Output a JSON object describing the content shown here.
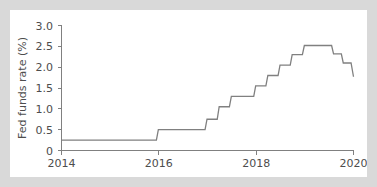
{
  "figure": {
    "background_color": "#d9d9d9",
    "panel_color": "#ffffff",
    "line_color": "#808080",
    "axis_color": "#808080",
    "text_color": "#4d4d4d"
  },
  "chart_data": {
    "type": "line",
    "title": "",
    "xlabel": "",
    "ylabel": "Fed funds rate (%)",
    "xlim": [
      2014.0,
      2020.0
    ],
    "ylim": [
      0,
      3.0
    ],
    "grid": false,
    "legend": false,
    "x_ticks": [
      2014,
      2016,
      2018,
      2020
    ],
    "x_tick_labels": [
      "2014",
      "2016",
      "2018",
      "2020"
    ],
    "y_ticks": [
      0,
      0.5,
      1.0,
      1.5,
      2.0,
      2.5,
      3.0
    ],
    "y_tick_labels": [
      "0",
      "0.5",
      "1.0",
      "1.5",
      "2.0",
      "2.5",
      "3.0"
    ],
    "series": [
      {
        "name": "Fed funds rate",
        "style": "step-post",
        "x": [
          2014.0,
          2015.95,
          2015.99,
          2016.95,
          2016.99,
          2017.2,
          2017.24,
          2017.45,
          2017.49,
          2017.95,
          2017.99,
          2018.2,
          2018.24,
          2018.45,
          2018.49,
          2018.7,
          2018.74,
          2018.95,
          2018.99,
          2019.55,
          2019.59,
          2019.75,
          2019.79,
          2019.95,
          2020.0
        ],
        "y": [
          0.25,
          0.25,
          0.5,
          0.5,
          0.75,
          0.75,
          1.05,
          1.05,
          1.3,
          1.3,
          1.55,
          1.55,
          1.8,
          1.8,
          2.05,
          2.05,
          2.3,
          2.3,
          2.52,
          2.52,
          2.32,
          2.32,
          2.1,
          2.1,
          1.77
        ]
      }
    ],
    "annotations": [],
    "key_points": {
      "start_rate": 0.25,
      "start_year": 2014,
      "first_hike_year": 2015.99,
      "first_hike_rate": 0.5,
      "peak_rate": 2.5,
      "peak_year_start": 2018.99,
      "peak_year_end": 2019.55,
      "end_rate": 1.75,
      "end_year": 2020
    }
  }
}
